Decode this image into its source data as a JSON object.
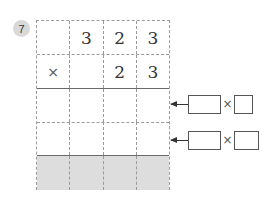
{
  "problem": {
    "number": "7",
    "grid": {
      "rows": [
        {
          "cells": [
            "",
            "3",
            "2",
            "3"
          ],
          "style": "dashed"
        },
        {
          "cells": [
            "×",
            "",
            "2",
            "3"
          ],
          "style": "solid"
        },
        {
          "cells": [
            "",
            "",
            "",
            ""
          ],
          "style": "dashed"
        },
        {
          "cells": [
            "",
            "",
            "",
            ""
          ],
          "style": "solid"
        },
        {
          "cells": [
            "",
            "",
            "",
            ""
          ],
          "style": "shaded"
        }
      ]
    },
    "hints": [
      {
        "operator": "×",
        "box1": "",
        "box2": ""
      },
      {
        "operator": "×",
        "box1": "",
        "box2": ""
      }
    ]
  }
}
